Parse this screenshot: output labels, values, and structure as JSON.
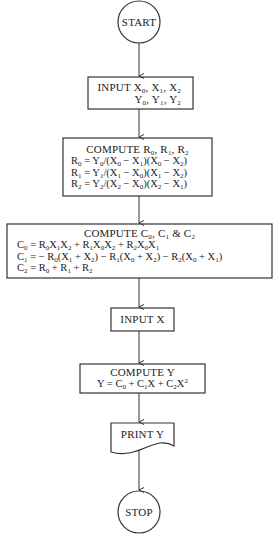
{
  "diagram": {
    "type": "flowchart",
    "nodes": [
      {
        "id": "start",
        "shape": "terminal-circle",
        "lines": [
          "START"
        ]
      },
      {
        "id": "input-points",
        "shape": "process-box",
        "lines": [
          "INPUT X<sub>0</sub>, X<sub>1</sub>, X<sub>2</sub>",
          "Y<sub>0</sub>, Y<sub>1</sub>, Y<sub>2</sub>"
        ]
      },
      {
        "id": "compute-r",
        "shape": "process-box",
        "lines": [
          "COMPUTE R<sub>0</sub>, R<sub>1</sub>, R<sub>2</sub>",
          "R<sub>0</sub> = Y<sub>0</sub>/(X<sub>0</sub> − X<sub>1</sub>)(X<sub>0</sub> − X<sub>2</sub>)",
          "R<sub>1</sub> = Y<sub>1</sub>/(X<sub>1</sub> − X<sub>0</sub>)(X<sub>1</sub> − X<sub>2</sub>)",
          "R<sub>2</sub> = Y<sub>2</sub>/(X<sub>2</sub> − X<sub>0</sub>)(X<sub>2</sub> − X<sub>1</sub>)"
        ]
      },
      {
        "id": "compute-c",
        "shape": "process-box",
        "lines": [
          "COMPUTE C<sub>0</sub>, C<sub>1</sub> &amp; C<sub>2</sub>",
          "C<sub>0</sub> = R<sub>0</sub>X<sub>1</sub>X<sub>2</sub> + R<sub>1</sub>X<sub>0</sub>X<sub>2</sub> + R<sub>2</sub>X<sub>0</sub>X<sub>1</sub>",
          "C<sub>1</sub> = − R<sub>0</sub>(X<sub>1</sub> + X<sub>2</sub>) − R<sub>1</sub>(X<sub>0</sub> + X<sub>2</sub>) − R<sub>2</sub>(X<sub>0</sub> + X<sub>1</sub>)",
          "C<sub>2</sub> = R<sub>0</sub> + R<sub>1</sub> + R<sub>2</sub>"
        ]
      },
      {
        "id": "input-x",
        "shape": "process-box",
        "lines": [
          "INPUT X"
        ]
      },
      {
        "id": "compute-y",
        "shape": "process-box",
        "lines": [
          "COMPUTE Y",
          "Y = C<sub>0</sub> + C<sub>1</sub>X + C<sub>2</sub>X<sup>2</sup>"
        ]
      },
      {
        "id": "print-y",
        "shape": "document",
        "lines": [
          "PRINT Y"
        ]
      },
      {
        "id": "stop",
        "shape": "terminal-circle",
        "lines": [
          "STOP"
        ]
      }
    ],
    "edges": [
      {
        "from": "start",
        "to": "input-points"
      },
      {
        "from": "input-points",
        "to": "compute-r"
      },
      {
        "from": "compute-r",
        "to": "compute-c"
      },
      {
        "from": "compute-c",
        "to": "input-x"
      },
      {
        "from": "input-x",
        "to": "compute-y"
      },
      {
        "from": "compute-y",
        "to": "print-y"
      },
      {
        "from": "print-y",
        "to": "stop"
      }
    ]
  }
}
